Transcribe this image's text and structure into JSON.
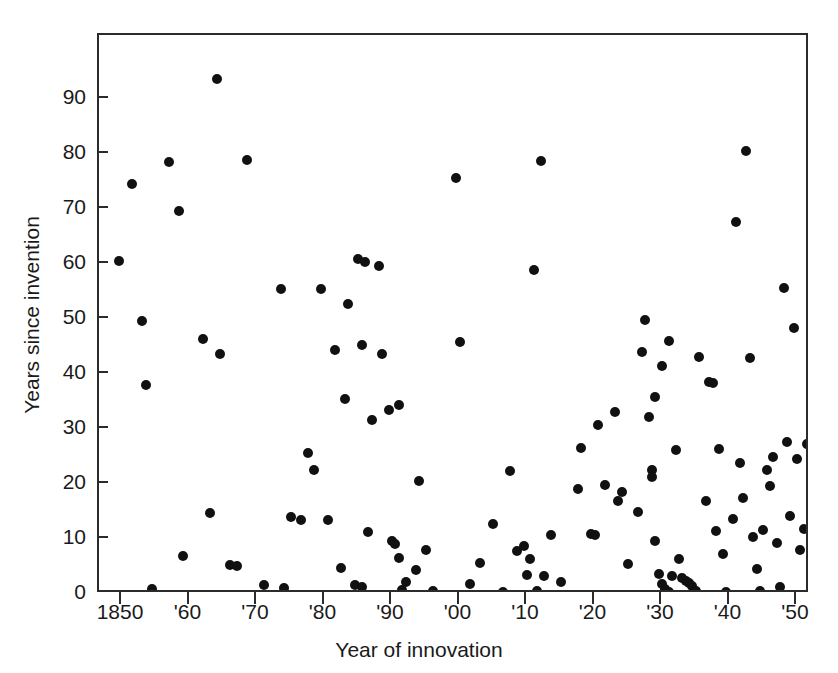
{
  "chart_data": {
    "type": "scatter",
    "title": "",
    "xlabel": "Year of innovation",
    "ylabel": "Years since invention",
    "xlim": [
      1846,
      1951
    ],
    "ylim": [
      0,
      101.6
    ],
    "grid": false,
    "legend": null,
    "marker": "filled-circle",
    "marker_color": "#111111",
    "xticks": [
      1850,
      1860,
      1870,
      1880,
      1890,
      1900,
      1910,
      1920,
      1930,
      1940,
      1950,
      1960,
      1970
    ],
    "xticklabels": [
      "1850",
      "'60",
      "'70",
      "'80",
      "'90",
      "'00",
      "'10",
      "'20",
      "'30",
      "'40",
      "'50",
      "'60",
      "'70"
    ],
    "yticks": [
      0,
      10,
      20,
      30,
      40,
      50,
      60,
      70,
      80,
      90
    ],
    "yticklabels": [
      "0",
      "10",
      "20",
      "30",
      "40",
      "50",
      "60",
      "70",
      "80",
      "90"
    ],
    "n_points": 137,
    "points": [
      [
        1849.5,
        60.5
      ],
      [
        1851.5,
        74.5
      ],
      [
        1853.0,
        49.6
      ],
      [
        1853.5,
        38.0
      ],
      [
        1854.5,
        0.9
      ],
      [
        1857.0,
        78.6
      ],
      [
        1858.5,
        69.6
      ],
      [
        1859.0,
        7.0
      ],
      [
        1862.0,
        46.4
      ],
      [
        1863.0,
        14.7
      ],
      [
        1864.0,
        93.6
      ],
      [
        1864.5,
        43.6
      ],
      [
        1866.0,
        5.2
      ],
      [
        1867.0,
        5.1
      ],
      [
        1868.5,
        78.9
      ],
      [
        1871.0,
        1.7
      ],
      [
        1873.5,
        55.4
      ],
      [
        1874.0,
        1.1
      ],
      [
        1875.0,
        14.0
      ],
      [
        1876.5,
        13.5
      ],
      [
        1877.5,
        25.6
      ],
      [
        1878.5,
        22.6
      ],
      [
        1879.5,
        55.4
      ],
      [
        1880.5,
        13.4
      ],
      [
        1881.5,
        44.4
      ],
      [
        1882.5,
        4.8
      ],
      [
        1883.0,
        35.4
      ],
      [
        1883.5,
        52.8
      ],
      [
        1884.5,
        1.6
      ],
      [
        1885.0,
        60.9
      ],
      [
        1885.5,
        1.3
      ],
      [
        1885.5,
        45.3
      ],
      [
        1886.0,
        60.4
      ],
      [
        1886.5,
        11.3
      ],
      [
        1887.0,
        31.6
      ],
      [
        1888.0,
        59.6
      ],
      [
        1888.5,
        43.6
      ],
      [
        1889.5,
        33.5
      ],
      [
        1890.0,
        9.6
      ],
      [
        1890.5,
        9.1
      ],
      [
        1891.0,
        34.4
      ],
      [
        1891.0,
        6.5
      ],
      [
        1891.5,
        0.7
      ],
      [
        1892.0,
        2.2
      ],
      [
        1893.5,
        4.4
      ],
      [
        1894.0,
        20.5
      ],
      [
        1895.0,
        8.0
      ],
      [
        1896.0,
        0.6
      ],
      [
        1899.5,
        75.6
      ],
      [
        1900.0,
        45.8
      ],
      [
        1901.5,
        1.9
      ],
      [
        1903.0,
        5.7
      ],
      [
        1905.0,
        12.7
      ],
      [
        1906.5,
        0.4
      ],
      [
        1907.5,
        22.4
      ],
      [
        1908.5,
        7.8
      ],
      [
        1909.5,
        8.8
      ],
      [
        1910.0,
        3.4
      ],
      [
        1910.5,
        6.4
      ],
      [
        1911.0,
        58.9
      ],
      [
        1911.5,
        0.5
      ],
      [
        1912.0,
        78.8
      ],
      [
        1912.5,
        3.3
      ],
      [
        1913.5,
        10.8
      ],
      [
        1915.0,
        2.1
      ],
      [
        1917.5,
        19.1
      ],
      [
        1918.0,
        26.6
      ],
      [
        1919.5,
        11.0
      ],
      [
        1920.0,
        10.8
      ],
      [
        1920.5,
        30.7
      ],
      [
        1921.5,
        19.9
      ],
      [
        1923.0,
        33.1
      ],
      [
        1923.5,
        17.0
      ],
      [
        1924.0,
        18.5
      ],
      [
        1925.0,
        5.4
      ],
      [
        1926.5,
        15.0
      ],
      [
        1927.0,
        44.0
      ],
      [
        1927.5,
        49.8
      ],
      [
        1928.0,
        32.1
      ],
      [
        1928.5,
        22.5
      ],
      [
        1928.5,
        21.3
      ],
      [
        1929.0,
        35.9
      ],
      [
        1929.0,
        9.7
      ],
      [
        1929.5,
        3.6
      ],
      [
        1930.0,
        41.4
      ],
      [
        1930.0,
        1.9
      ],
      [
        1930.5,
        1.0
      ],
      [
        1931.0,
        0.4
      ],
      [
        1931.0,
        46.0
      ],
      [
        1931.5,
        3.2
      ],
      [
        1932.0,
        26.1
      ],
      [
        1932.5,
        6.4
      ],
      [
        1933.0,
        2.9
      ],
      [
        1933.5,
        2.4
      ],
      [
        1934.0,
        2.0
      ],
      [
        1934.5,
        1.5
      ],
      [
        1935.0,
        0.5
      ],
      [
        1935.5,
        43.1
      ],
      [
        1936.5,
        17.0
      ],
      [
        1937.0,
        38.6
      ],
      [
        1937.5,
        38.4
      ],
      [
        1938.0,
        11.5
      ],
      [
        1938.5,
        26.4
      ],
      [
        1939.0,
        7.3
      ],
      [
        1939.5,
        0.3
      ],
      [
        1940.5,
        13.6
      ],
      [
        1941.0,
        67.7
      ],
      [
        1941.5,
        23.9
      ],
      [
        1942.0,
        17.5
      ],
      [
        1942.5,
        80.6
      ],
      [
        1943.0,
        43.0
      ],
      [
        1943.5,
        10.3
      ],
      [
        1944.0,
        4.6
      ],
      [
        1944.5,
        0.5
      ],
      [
        1945.0,
        11.7
      ],
      [
        1945.5,
        22.6
      ],
      [
        1946.0,
        19.6
      ],
      [
        1946.5,
        25.0
      ],
      [
        1947.0,
        9.3
      ],
      [
        1947.5,
        1.2
      ],
      [
        1948.0,
        55.6
      ],
      [
        1948.5,
        27.6
      ],
      [
        1949.0,
        14.1
      ],
      [
        1949.5,
        48.3
      ],
      [
        1950.0,
        24.5
      ],
      [
        1950.5,
        8.0
      ],
      [
        1951.0,
        11.9
      ],
      [
        1951.5,
        27.3
      ],
      [
        1952.5,
        13.9
      ],
      [
        1954.0,
        71.5
      ],
      [
        1955.0,
        34.5
      ],
      [
        1955.5,
        24.1
      ],
      [
        1956.0,
        31.8
      ],
      [
        1957.0,
        14.0
      ],
      [
        1957.5,
        5.0
      ],
      [
        1958.0,
        3.8
      ],
      [
        1958.5,
        4.2
      ],
      [
        1959.0,
        0.6
      ],
      [
        1964.5,
        13.0
      ],
      [
        1965.5,
        14.8
      ],
      [
        1966.5,
        12.3
      ],
      [
        1968.0,
        12.1
      ]
    ]
  },
  "axes": {
    "x_title": "Year of innovation",
    "y_title": "Years since invention"
  }
}
